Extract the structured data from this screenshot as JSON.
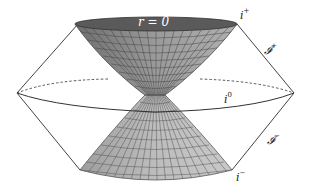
{
  "diagram": {
    "labels": {
      "singularity": "r = 0",
      "future_timelike": {
        "base": "i",
        "sup": "+"
      },
      "future_null": {
        "base": "𝓘",
        "sup": "+"
      },
      "spatial_infinity": {
        "base": "i",
        "sup": "0"
      },
      "past_null": {
        "base": "𝓘",
        "sup": "−"
      },
      "past_timelike": {
        "base": "i",
        "sup": "−"
      }
    },
    "colors": {
      "top_disc": "#5a5a5a",
      "upper_cone": "#8c8c8c",
      "lower_cone": "#b4b4b4",
      "grid_lines": "#444444",
      "outline": "#333333"
    }
  }
}
